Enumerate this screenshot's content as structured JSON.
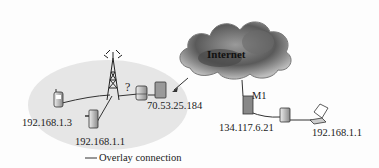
{
  "diagram": {
    "cloud": {
      "label": "Internet"
    },
    "nodes": {
      "phone": {
        "label": "192.168.1.3",
        "icon": "mobile-phone-icon"
      },
      "pda": {
        "label": "192.168.1.1",
        "icon": "pda-device-icon"
      },
      "tower": {
        "icon": "cell-tower-icon"
      },
      "question": {
        "label": "?"
      },
      "nat_router": {
        "label": "70.53.25.184",
        "icon": "router-icon"
      },
      "m1": {
        "name": "M1",
        "label": "134.117.6.21",
        "icon": "server-icon"
      },
      "laptop": {
        "label": "192.168.1.1",
        "icon": "laptop-icon"
      }
    },
    "legend": {
      "label": "Overlay connection"
    }
  }
}
